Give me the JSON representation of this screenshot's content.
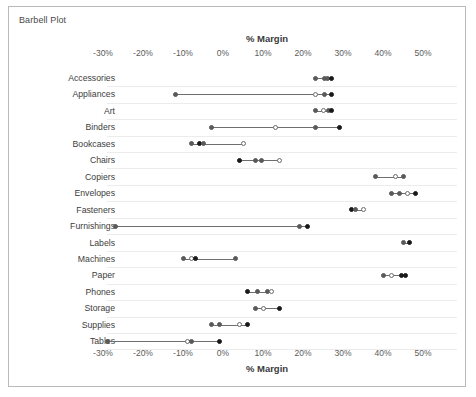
{
  "chart_title": "Barbell Plot",
  "chart_data": {
    "type": "scatter",
    "subtype": "barbell-dumbbell",
    "title": "Barbell Plot",
    "xlabel": "% Margin",
    "xlabel_top": "% Margin",
    "ylabel": "",
    "grid": true,
    "legend_position": "none",
    "xlim": [
      -33,
      53
    ],
    "xticks": [
      -30,
      -20,
      -10,
      0,
      10,
      20,
      30,
      40,
      50
    ],
    "xtick_labels": [
      "-30%",
      "-20%",
      "-10%",
      "0%",
      "10%",
      "20%",
      "30%",
      "40%",
      "50%"
    ],
    "categories": [
      "Accessories",
      "Appliances",
      "Art",
      "Binders",
      "Bookcases",
      "Chairs",
      "Copiers",
      "Envelopes",
      "Fasteners",
      "Furnishings",
      "Labels",
      "Machines",
      "Paper",
      "Phones",
      "Storage",
      "Supplies",
      "Tables"
    ],
    "rows": [
      {
        "category": "Accessories",
        "min": 23,
        "max": 27,
        "points": [
          {
            "value": 23,
            "style": "filled-gray"
          },
          {
            "value": 25.4,
            "style": "filled-gray"
          },
          {
            "value": 26,
            "style": "filled-gray"
          },
          {
            "value": 27,
            "style": "filled-dark"
          }
        ]
      },
      {
        "category": "Appliances",
        "min": -12,
        "max": 27,
        "points": [
          {
            "value": -12,
            "style": "filled-gray"
          },
          {
            "value": 23,
            "style": "open"
          },
          {
            "value": 25.3,
            "style": "filled-gray"
          },
          {
            "value": 27,
            "style": "filled-dark"
          }
        ]
      },
      {
        "category": "Art",
        "min": 23,
        "max": 27,
        "points": [
          {
            "value": 23,
            "style": "filled-gray"
          },
          {
            "value": 25,
            "style": "open"
          },
          {
            "value": 26.4,
            "style": "filled-gray"
          },
          {
            "value": 27,
            "style": "filled-dark"
          }
        ]
      },
      {
        "category": "Binders",
        "min": -3,
        "max": 29,
        "points": [
          {
            "value": -3,
            "style": "filled-gray"
          },
          {
            "value": 13,
            "style": "open"
          },
          {
            "value": 23,
            "style": "filled-gray"
          },
          {
            "value": 29,
            "style": "filled-dark"
          }
        ]
      },
      {
        "category": "Bookcases",
        "min": -8,
        "max": 5,
        "points": [
          {
            "value": -8,
            "style": "filled-gray"
          },
          {
            "value": -6,
            "style": "filled-dark"
          },
          {
            "value": -4.8,
            "style": "filled-gray"
          },
          {
            "value": 5,
            "style": "open"
          }
        ]
      },
      {
        "category": "Chairs",
        "min": 4,
        "max": 14,
        "points": [
          {
            "value": 4,
            "style": "filled-dark"
          },
          {
            "value": 8,
            "style": "filled-gray"
          },
          {
            "value": 9.5,
            "style": "filled-gray"
          },
          {
            "value": 14,
            "style": "open"
          }
        ]
      },
      {
        "category": "Copiers",
        "min": 38,
        "max": 45,
        "points": [
          {
            "value": 38,
            "style": "filled-gray"
          },
          {
            "value": 43,
            "style": "open"
          },
          {
            "value": 45,
            "style": "filled-gray"
          }
        ]
      },
      {
        "category": "Envelopes",
        "min": 42,
        "max": 48,
        "points": [
          {
            "value": 42,
            "style": "filled-gray"
          },
          {
            "value": 44,
            "style": "filled-gray"
          },
          {
            "value": 46,
            "style": "open"
          },
          {
            "value": 48,
            "style": "filled-dark"
          }
        ]
      },
      {
        "category": "Fasteners",
        "min": 32,
        "max": 35,
        "points": [
          {
            "value": 32,
            "style": "filled-dark"
          },
          {
            "value": 33.2,
            "style": "filled-gray"
          },
          {
            "value": 35,
            "style": "open"
          }
        ]
      },
      {
        "category": "Furnishings",
        "min": -27,
        "max": 21,
        "points": [
          {
            "value": -27,
            "style": "filled-gray"
          },
          {
            "value": 19,
            "style": "filled-gray"
          },
          {
            "value": 21,
            "style": "filled-dark"
          }
        ]
      },
      {
        "category": "Labels",
        "min": 45,
        "max": 46.5,
        "points": [
          {
            "value": 45,
            "style": "filled-gray"
          },
          {
            "value": 46.5,
            "style": "filled-dark"
          }
        ]
      },
      {
        "category": "Machines",
        "min": -10,
        "max": 3,
        "points": [
          {
            "value": -10,
            "style": "filled-gray"
          },
          {
            "value": -8,
            "style": "open"
          },
          {
            "value": -6.8,
            "style": "filled-dark"
          },
          {
            "value": 3,
            "style": "filled-gray"
          }
        ]
      },
      {
        "category": "Paper",
        "min": 40,
        "max": 45.5,
        "points": [
          {
            "value": 40,
            "style": "filled-gray"
          },
          {
            "value": 42,
            "style": "open"
          },
          {
            "value": 44.5,
            "style": "filled-dark"
          },
          {
            "value": 45.5,
            "style": "filled-dark"
          }
        ]
      },
      {
        "category": "Phones",
        "min": 6,
        "max": 12,
        "points": [
          {
            "value": 6,
            "style": "filled-dark"
          },
          {
            "value": 8.5,
            "style": "filled-gray"
          },
          {
            "value": 11.2,
            "style": "filled-gray"
          },
          {
            "value": 12,
            "style": "open"
          }
        ]
      },
      {
        "category": "Storage",
        "min": 8,
        "max": 14,
        "points": [
          {
            "value": 8,
            "style": "filled-gray"
          },
          {
            "value": 10,
            "style": "open"
          },
          {
            "value": 14,
            "style": "filled-dark"
          }
        ]
      },
      {
        "category": "Supplies",
        "min": -3,
        "max": 6,
        "points": [
          {
            "value": -3,
            "style": "filled-gray"
          },
          {
            "value": -1,
            "style": "filled-gray"
          },
          {
            "value": 4,
            "style": "open"
          },
          {
            "value": 6,
            "style": "filled-dark"
          }
        ]
      },
      {
        "category": "Tables",
        "min": -29,
        "max": -1,
        "points": [
          {
            "value": -29,
            "style": "filled-gray"
          },
          {
            "value": -9,
            "style": "open"
          },
          {
            "value": -8,
            "style": "filled-gray"
          },
          {
            "value": -1,
            "style": "filled-dark"
          }
        ]
      }
    ]
  },
  "colors": {
    "marker_dark": "#1a1a1a",
    "marker_gray": "#5a5a5a",
    "marker_open_border": "#6b6b6b",
    "connector": "#6e6e6e",
    "gridline": "#ececec",
    "frame_border": "#b9b9b9",
    "text": "#3d3d3d"
  }
}
